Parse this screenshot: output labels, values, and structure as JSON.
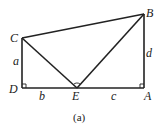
{
  "figure": {
    "caption": "(a)",
    "points": {
      "A": {
        "label": "A",
        "x": 144,
        "y": 88
      },
      "B": {
        "label": "B",
        "x": 144,
        "y": 14
      },
      "C": {
        "label": "C",
        "x": 22,
        "y": 38
      },
      "D": {
        "label": "D",
        "x": 22,
        "y": 88
      },
      "E": {
        "label": "E",
        "x": 77,
        "y": 88
      }
    },
    "segment_labels": {
      "a": "a",
      "b": "b",
      "c": "c",
      "d": "d"
    },
    "right_angles": [
      "D",
      "A"
    ],
    "marked_angle": "E"
  }
}
